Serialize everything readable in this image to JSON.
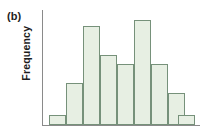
{
  "figure": {
    "panel_label": "(b)",
    "y_axis_title": "Frequency",
    "x_axis_title": "",
    "colors": {
      "bar_fill": "#e7efe3",
      "bar_border": "#76917a",
      "axis": "#8a8a8a",
      "text": "#1d1d1d",
      "background": "#ffffff"
    }
  },
  "chart_data": {
    "type": "bar",
    "title": "(b)",
    "subtitle": "",
    "xlabel": "",
    "ylabel": "Frequency",
    "grid": false,
    "legend": null,
    "axis_tick_labels": {
      "x": [],
      "y": []
    },
    "ylim": [
      0,
      36
    ],
    "xlim": [
      0,
      11
    ],
    "categories": [
      "1",
      "2",
      "3",
      "4",
      "5",
      "6",
      "7",
      "8",
      "9",
      "10",
      "11"
    ],
    "values": [
      3,
      13,
      31,
      22,
      19,
      33,
      19,
      10,
      5,
      0,
      3
    ],
    "bar_geometry": [
      {
        "index": 0,
        "left_pct": 4.4,
        "width_pct": 10.8,
        "height_pct": 6.0
      },
      {
        "index": 1,
        "left_pct": 15.2,
        "width_pct": 10.8,
        "height_pct": 25.2
      },
      {
        "index": 2,
        "left_pct": 26.0,
        "width_pct": 10.8,
        "height_pct": 77.5
      },
      {
        "index": 3,
        "left_pct": 36.8,
        "width_pct": 10.8,
        "height_pct": 58.0
      },
      {
        "index": 4,
        "left_pct": 47.6,
        "width_pct": 10.8,
        "height_pct": 51.5
      },
      {
        "index": 5,
        "left_pct": 58.4,
        "width_pct": 10.8,
        "height_pct": 82.5
      },
      {
        "index": 6,
        "left_pct": 69.2,
        "width_pct": 10.8,
        "height_pct": 51.5
      },
      {
        "index": 7,
        "left_pct": 80.0,
        "width_pct": 10.8,
        "height_pct": 24.0
      },
      {
        "index": 8,
        "left_pct": 90.8,
        "width_pct": 10.8,
        "height_pct": 11.0
      },
      {
        "index": 9,
        "left_pct": 101.6,
        "width_pct": 10.8,
        "height_pct": 0.0
      },
      {
        "index": 10,
        "left_pct": 86.5,
        "width_pct": 10.8,
        "height_pct": 6.5
      }
    ]
  }
}
